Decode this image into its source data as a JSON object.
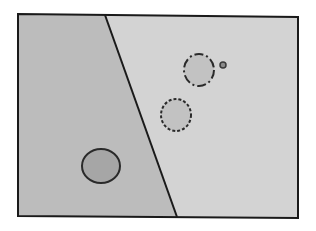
{
  "diagram": {
    "colors": {
      "background": "#ffffff",
      "left_region": "#bcbcbc",
      "right_region": "#d3d3d3",
      "stroke": "#1a1a1a",
      "solid_circle_fill": "#a6a6a6",
      "dashed_circle_fill": "#c2c2c2",
      "dashdot_circle_fill": "#c2c2c2",
      "small_dot_fill": "#8a8a8a"
    },
    "frame": {
      "points": "18,14 298,17 298,218 18,216"
    },
    "divider": {
      "x1": 105,
      "y1": 15,
      "x2": 177,
      "y2": 217
    },
    "left_region_points": "18,14 105,15 177,217 18,216",
    "right_region_points": "105,15 298,17 298,218 177,217",
    "circles": [
      {
        "id": "solid-circle",
        "cx": 101,
        "cy": 166,
        "rx": 19,
        "ry": 17,
        "style": "solid"
      },
      {
        "id": "dashed-circle",
        "cx": 176,
        "cy": 115,
        "rx": 15,
        "ry": 16,
        "style": "dashed"
      },
      {
        "id": "dashdot-circle",
        "cx": 199,
        "cy": 70,
        "rx": 15,
        "ry": 16,
        "style": "dash-dot"
      },
      {
        "id": "small-dot",
        "cx": 223,
        "cy": 65,
        "r": 3,
        "style": "solid"
      }
    ]
  }
}
